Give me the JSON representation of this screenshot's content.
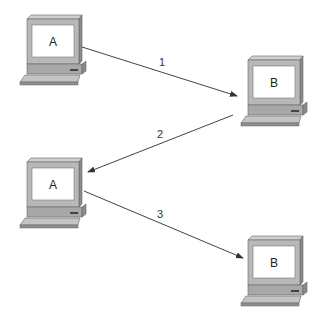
{
  "diagram": {
    "nodes": [
      {
        "id": "pc-a-1",
        "label": "A",
        "x": 20,
        "y": 15
      },
      {
        "id": "pc-b-1",
        "label": "B",
        "x": 241,
        "y": 56
      },
      {
        "id": "pc-a-2",
        "label": "A",
        "x": 20,
        "y": 158
      },
      {
        "id": "pc-b-2",
        "label": "B",
        "x": 241,
        "y": 236
      }
    ],
    "edges": [
      {
        "id": "edge-1",
        "label": "1",
        "from": "pc-a-1",
        "to": "pc-b-1"
      },
      {
        "id": "edge-2",
        "label": "2",
        "from": "pc-b-1",
        "to": "pc-a-2"
      },
      {
        "id": "edge-3",
        "label": "3",
        "from": "pc-a-2",
        "to": "pc-b-2"
      }
    ],
    "colors": {
      "monitor_face": "#b8b8b8",
      "monitor_top": "#d0d0d0",
      "monitor_side": "#8c8c8c",
      "screen": "#ffffff",
      "outline": "#555555",
      "line": "#444444"
    }
  }
}
